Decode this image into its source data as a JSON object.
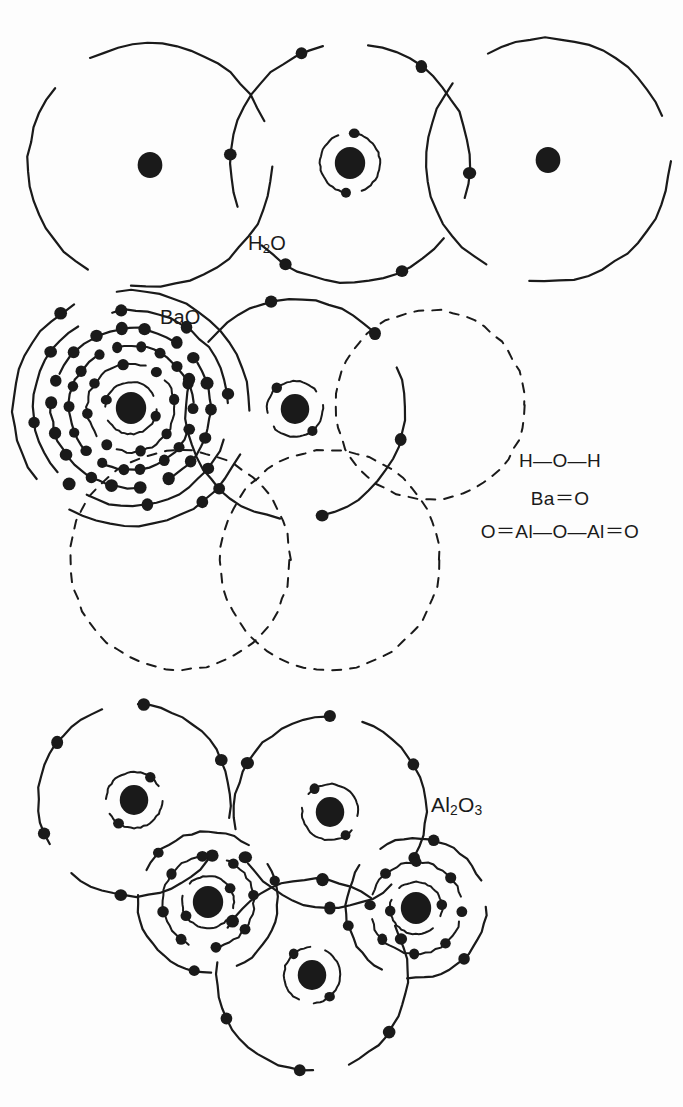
{
  "figure": {
    "title": "",
    "background_color": "#fdfdfd",
    "ink_color": "#1a1a1a"
  },
  "labels": {
    "h2o": {
      "text": "H2O",
      "formula_html": "H<sub>2</sub>O"
    },
    "bao": {
      "text": "BaO",
      "formula_html": "BaO"
    },
    "al2o3": {
      "text": "Al2O3",
      "formula_html": "Al<sub>2</sub>O<sub>3</sub>"
    }
  },
  "structural_formulas": [
    {
      "id": "water",
      "text": "H—O—H"
    },
    {
      "id": "barium-oxide",
      "text": "Ba＝O"
    },
    {
      "id": "aluminum-oxide",
      "text": "O＝Al—O—Al＝O"
    }
  ],
  "diagrams": [
    {
      "id": "h2o",
      "label": "H2O",
      "atoms": [
        {
          "element": "H",
          "cx": 150,
          "cy": 165,
          "nucleus_r": 13,
          "shells": [
            {
              "r": 122,
              "electrons": 0,
              "style": "solid-broken"
            }
          ]
        },
        {
          "element": "O",
          "cx": 350,
          "cy": 163,
          "nucleus_r": 16,
          "shells": [
            {
              "r": 30,
              "electrons": 2,
              "style": "solid-broken"
            },
            {
              "r": 120,
              "electrons": 6,
              "style": "solid-broken"
            }
          ]
        },
        {
          "element": "H",
          "cx": 548,
          "cy": 160,
          "nucleus_r": 13,
          "shells": [
            {
              "r": 122,
              "electrons": 0,
              "style": "solid-broken"
            }
          ]
        }
      ]
    },
    {
      "id": "bao",
      "label": "BaO",
      "atoms": [
        {
          "element": "Ba",
          "cx": 131,
          "cy": 408,
          "nucleus_r": 16,
          "shells": [
            {
              "r": 26,
              "electrons": 2,
              "style": "solid-broken"
            },
            {
              "r": 44,
              "electrons": 8,
              "style": "solid-broken"
            },
            {
              "r": 62,
              "electrons": 18,
              "style": "solid-broken"
            },
            {
              "r": 80,
              "electrons": 18,
              "style": "solid-broken"
            },
            {
              "r": 98,
              "electrons": 8,
              "style": "solid-broken"
            },
            {
              "r": 118,
              "electrons": 2,
              "style": "solid-broken"
            }
          ]
        },
        {
          "element": "O",
          "cx": 295,
          "cy": 409,
          "nucleus_r": 15,
          "shells": [
            {
              "r": 28,
              "electrons": 2,
              "style": "solid-broken"
            },
            {
              "r": 110,
              "electrons": 6,
              "style": "solid-broken"
            }
          ]
        },
        {
          "element": "ghost",
          "cx": 180,
          "cy": 560,
          "nucleus_r": 0,
          "shells": [
            {
              "r": 110,
              "electrons": 0,
              "style": "dashed"
            }
          ]
        },
        {
          "element": "ghost",
          "cx": 330,
          "cy": 560,
          "nucleus_r": 0,
          "shells": [
            {
              "r": 110,
              "electrons": 0,
              "style": "dashed"
            }
          ]
        },
        {
          "element": "ghost",
          "cx": 430,
          "cy": 405,
          "nucleus_r": 0,
          "shells": [
            {
              "r": 95,
              "electrons": 0,
              "style": "dashed"
            }
          ]
        }
      ]
    },
    {
      "id": "al2o3",
      "label": "Al2O3",
      "atoms": [
        {
          "element": "O",
          "cx": 134,
          "cy": 800,
          "nucleus_r": 15,
          "shells": [
            {
              "r": 28,
              "electrons": 2,
              "style": "solid-broken"
            },
            {
              "r": 96,
              "electrons": 6,
              "style": "solid-broken"
            }
          ]
        },
        {
          "element": "O",
          "cx": 330,
          "cy": 812,
          "nucleus_r": 15,
          "shells": [
            {
              "r": 28,
              "electrons": 2,
              "style": "solid-broken"
            },
            {
              "r": 96,
              "electrons": 6,
              "style": "solid-broken"
            }
          ]
        },
        {
          "element": "Al",
          "cx": 208,
          "cy": 902,
          "nucleus_r": 16,
          "shells": [
            {
              "r": 26,
              "electrons": 2,
              "style": "solid-broken"
            },
            {
              "r": 46,
              "electrons": 8,
              "style": "solid-broken"
            },
            {
              "r": 70,
              "electrons": 3,
              "style": "solid-broken"
            }
          ]
        },
        {
          "element": "Al",
          "cx": 416,
          "cy": 908,
          "nucleus_r": 16,
          "shells": [
            {
              "r": 26,
              "electrons": 2,
              "style": "solid-broken"
            },
            {
              "r": 46,
              "electrons": 8,
              "style": "solid-broken"
            },
            {
              "r": 70,
              "electrons": 3,
              "style": "solid-broken"
            }
          ]
        },
        {
          "element": "O",
          "cx": 312,
          "cy": 975,
          "nucleus_r": 15,
          "shells": [
            {
              "r": 28,
              "electrons": 2,
              "style": "solid-broken"
            },
            {
              "r": 96,
              "electrons": 6,
              "style": "solid-broken"
            }
          ]
        }
      ]
    }
  ]
}
